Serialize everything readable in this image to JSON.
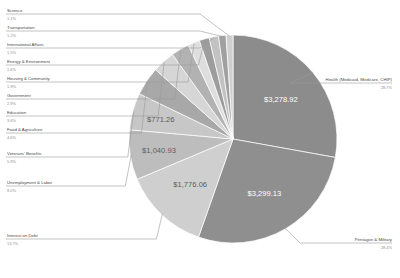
{
  "chart_data": {
    "type": "pie",
    "title": "",
    "currency_symbol": "$",
    "legend_position": "callout-labels",
    "slices": [
      {
        "label": "Health (Medicaid, Medicare, CHIP)",
        "pct_label": "28.7%",
        "value": 28.7,
        "amount": "$3,278.92",
        "color": "#8c8c8c",
        "side": "right"
      },
      {
        "label": "Pentagon & Military",
        "pct_label": "28.4%",
        "value": 28.4,
        "amount": "$3,299.13",
        "color": "#8f8f8f",
        "side": "right"
      },
      {
        "label": "Interest on Debt",
        "pct_label": "13.7%",
        "value": 13.7,
        "amount": "$1,776.06",
        "color": "#cfcfcf",
        "side": "left"
      },
      {
        "label": "Unemployment & Labor",
        "pct_label": "8.0%",
        "value": 8.0,
        "amount": "$1,040.93",
        "color": "#bdbdbd",
        "side": "left"
      },
      {
        "label": "Veterans' Benefits",
        "pct_label": "5.9%",
        "value": 5.9,
        "amount": "$771.26",
        "color": "#c7c7c7",
        "side": "left"
      },
      {
        "label": "Food & Agriculture",
        "pct_label": "4.6%",
        "value": 4.6,
        "amount": "",
        "color": "#a8a8a8",
        "side": "left"
      },
      {
        "label": "Education",
        "pct_label": "3.6%",
        "value": 3.6,
        "amount": "",
        "color": "#d6d6d6",
        "side": "left"
      },
      {
        "label": "Government",
        "pct_label": "2.9%",
        "value": 2.9,
        "amount": "",
        "color": "#b2b2b2",
        "side": "left"
      },
      {
        "label": "Housing & Community",
        "pct_label": "1.9%",
        "value": 1.9,
        "amount": "",
        "color": "#dedede",
        "side": "left"
      },
      {
        "label": "Energy & Environment",
        "pct_label": "1.6%",
        "value": 1.6,
        "amount": "",
        "color": "#9d9d9d",
        "side": "left"
      },
      {
        "label": "International Affairs",
        "pct_label": "1.5%",
        "value": 1.5,
        "amount": "",
        "color": "#c2c2c2",
        "side": "left"
      },
      {
        "label": "Transportation",
        "pct_label": "1.2%",
        "value": 1.2,
        "amount": "",
        "color": "#a0a0a0",
        "side": "left"
      },
      {
        "label": "Science",
        "pct_label": "1.1%",
        "value": 1.1,
        "amount": "",
        "color": "#d0d0d0",
        "side": "left"
      }
    ],
    "background": "#ffffff"
  }
}
